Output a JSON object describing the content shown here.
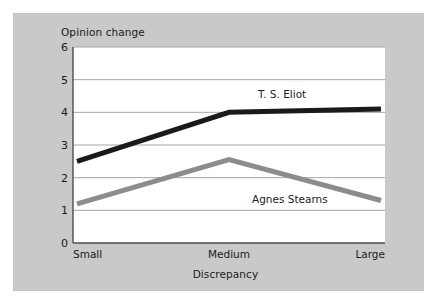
{
  "figure": {
    "panel_bg": "#c9c9c9",
    "page_bg": "#ffffff",
    "plot_bg": "#ffffff"
  },
  "chart_data": {
    "type": "line",
    "title": "Opinion change",
    "xlabel": "Discrepancy",
    "ylabel": "Opinion change",
    "categories": [
      "Small",
      "Medium",
      "Large"
    ],
    "ylim": [
      0,
      6
    ],
    "yticks": [
      0,
      1,
      2,
      3,
      4,
      5,
      6
    ],
    "ytick_labels": [
      "0",
      "1",
      "2",
      "3",
      "4",
      "5",
      "6"
    ],
    "grid": true,
    "grid_axis": "y",
    "legend": "inline-labels",
    "series": [
      {
        "name": "T. S. Eliot",
        "values": [
          2.5,
          4.0,
          4.1
        ],
        "color": "#1a1a1a",
        "width": 5
      },
      {
        "name": "Agnes Stearns",
        "values": [
          1.2,
          2.55,
          1.3
        ],
        "color": "#8c8c8c",
        "width": 5
      }
    ],
    "annotations": [
      {
        "text": "T. S. Eliot",
        "x": "between-medium-and-large",
        "y": 4.45
      },
      {
        "text": "Agnes Stearns",
        "x": "between-medium-and-large",
        "y": 1.62
      }
    ]
  }
}
